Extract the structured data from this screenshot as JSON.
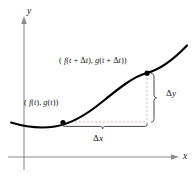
{
  "figure": {
    "kind": "parametric-curve-difference-diagram",
    "background_color": "#ffffff"
  },
  "axes": {
    "y_axis_label": "y",
    "x_axis_label": "x",
    "axis_color": "#8c8c8c",
    "y_axis_x": 24,
    "y_axis_top": 18,
    "y_axis_bottom": 170,
    "x_axis_y": 157,
    "x_axis_left": 8,
    "x_axis_right": 178
  },
  "curve": {
    "color": "#000000",
    "width": 2.1,
    "description": "parametric curve rising to the right"
  },
  "points": [
    {
      "id": "lower-point",
      "label": "( f(t), g(t))",
      "label_parts": {
        "open": "(",
        "f_of_t": "f(t)",
        "comma": ", ",
        "g_of_t": "g(t)",
        "close": ")"
      },
      "x": 63,
      "y": 122,
      "marker_color": "#000000",
      "marker_radius": 2.6
    },
    {
      "id": "upper-point",
      "label": "( f(t + Δt), g(t + Δt))",
      "label_parts": {
        "open": "(",
        "f_of_t_dt": "f(t + Δt)",
        "comma": ", ",
        "g_of_t_dt": "g(t + Δt)",
        "close": ")"
      },
      "x": 147,
      "y": 73,
      "marker_color": "#000000",
      "marker_radius": 2.6
    }
  ],
  "dashed_guides": {
    "color": "#e9a6a6",
    "dash_pattern": "2 2",
    "vertical": {
      "x": 147,
      "y_top": 73,
      "y_bottom": 122
    },
    "horizontal": {
      "y": 122,
      "x_left": 63,
      "x_right": 147
    }
  },
  "braces": {
    "delta_y": {
      "label": "Δy",
      "delta": "Δ",
      "variable": "y",
      "orientation": "vertical",
      "x": 154,
      "y_top": 73,
      "y_bottom": 122,
      "color": "#3a3a3a"
    },
    "delta_x": {
      "label": "Δx",
      "delta": "Δ",
      "variable": "x",
      "orientation": "horizontal",
      "y": 127,
      "x_left": 62,
      "x_right": 148,
      "color": "#3a3a3a"
    }
  }
}
